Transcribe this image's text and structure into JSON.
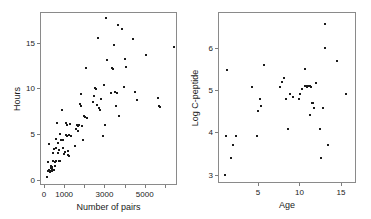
{
  "figure": {
    "background": "#ffffff",
    "point_color": "#1a1a1a",
    "frame_color": "#8a8a8a",
    "panel_count": 2
  },
  "chart_data": [
    {
      "type": "scatter",
      "title": "",
      "xlabel": "Number of pairs",
      "ylabel": "Hours",
      "xlim": [
        -200,
        6600
      ],
      "ylim": [
        -0.6,
        18.4
      ],
      "grid": false,
      "legend": null,
      "xticks": [
        0,
        1000,
        2000,
        3000,
        4000,
        5000,
        6000
      ],
      "xticklabels": [
        "0",
        "1000",
        "",
        "3000",
        "",
        "5000",
        ""
      ],
      "yticks": [
        0,
        5,
        10,
        15
      ],
      "yticklabels": [
        "0",
        "5",
        "10",
        "15"
      ],
      "points": [
        [
          120,
          0.4
        ],
        [
          150,
          1.0
        ],
        [
          170,
          2.0
        ],
        [
          200,
          1.2
        ],
        [
          210,
          4.0
        ],
        [
          260,
          0.9
        ],
        [
          280,
          1.4
        ],
        [
          300,
          1.1
        ],
        [
          310,
          1.6
        ],
        [
          330,
          1.3
        ],
        [
          350,
          1.0
        ],
        [
          360,
          1.5
        ],
        [
          380,
          2.1
        ],
        [
          400,
          3.0
        ],
        [
          420,
          2.2
        ],
        [
          440,
          1.2
        ],
        [
          460,
          3.5
        ],
        [
          480,
          2.0
        ],
        [
          500,
          1.6
        ],
        [
          520,
          3.6
        ],
        [
          540,
          2.2
        ],
        [
          560,
          4.6
        ],
        [
          600,
          6.3
        ],
        [
          620,
          4.1
        ],
        [
          650,
          3.0
        ],
        [
          680,
          2.1
        ],
        [
          700,
          3.4
        ],
        [
          720,
          2.2
        ],
        [
          760,
          5.1
        ],
        [
          800,
          4.5
        ],
        [
          840,
          7.7
        ],
        [
          880,
          3.6
        ],
        [
          900,
          4.4
        ],
        [
          950,
          2.9
        ],
        [
          1000,
          3.1
        ],
        [
          1020,
          5.0
        ],
        [
          1050,
          6.3
        ],
        [
          1080,
          6.1
        ],
        [
          1100,
          4.9
        ],
        [
          1120,
          3.2
        ],
        [
          1140,
          2.8
        ],
        [
          1180,
          2.7
        ],
        [
          1200,
          5.0
        ],
        [
          1250,
          6.2
        ],
        [
          1300,
          4.9
        ],
        [
          1500,
          3.8
        ],
        [
          1550,
          5.7
        ],
        [
          1600,
          6.1
        ],
        [
          1620,
          5.4
        ],
        [
          1650,
          6.0
        ],
        [
          1700,
          6.1
        ],
        [
          1750,
          8.4
        ],
        [
          1780,
          8.2
        ],
        [
          1800,
          9.5
        ],
        [
          1850,
          6.0
        ],
        [
          1900,
          4.4
        ],
        [
          1950,
          7.1
        ],
        [
          2000,
          7.0
        ],
        [
          2050,
          12.4
        ],
        [
          2100,
          6.9
        ],
        [
          2400,
          8.6
        ],
        [
          2450,
          9.3
        ],
        [
          2500,
          10.2
        ],
        [
          2550,
          10.1
        ],
        [
          2600,
          8.3
        ],
        [
          2650,
          15.7
        ],
        [
          2700,
          8.0
        ],
        [
          2750,
          7.8
        ],
        [
          2800,
          9.0
        ],
        [
          2900,
          4.9
        ],
        [
          2950,
          10.5
        ],
        [
          3000,
          6.1
        ],
        [
          3050,
          17.9
        ],
        [
          3100,
          13.2
        ],
        [
          3250,
          9.6
        ],
        [
          3300,
          12.4
        ],
        [
          3350,
          12.2
        ],
        [
          3400,
          14.9
        ],
        [
          3450,
          9.7
        ],
        [
          3500,
          8.2
        ],
        [
          3550,
          9.6
        ],
        [
          3600,
          17.1
        ],
        [
          3650,
          7.1
        ],
        [
          3800,
          16.6
        ],
        [
          3900,
          10.3
        ],
        [
          3950,
          13.4
        ],
        [
          4000,
          12.5
        ],
        [
          4350,
          15.5
        ],
        [
          4450,
          9.7
        ],
        [
          4550,
          8.9
        ],
        [
          5000,
          13.8
        ],
        [
          5600,
          9.1
        ],
        [
          5650,
          8.2
        ],
        [
          5700,
          8.1
        ],
        [
          6400,
          14.7
        ]
      ]
    },
    {
      "type": "scatter",
      "title": "",
      "xlabel": "Age",
      "ylabel": "Log C-peptide",
      "xlim": [
        0.2,
        16.8
      ],
      "ylim": [
        2.8,
        6.85
      ],
      "grid": false,
      "legend": null,
      "xticks": [
        5,
        10,
        15
      ],
      "xticklabels": [
        "5",
        "10",
        "15"
      ],
      "yticks": [
        3,
        4,
        5,
        6
      ],
      "yticklabels": [
        "3",
        "4",
        "5",
        "6"
      ],
      "points": [
        [
          0.9,
          3.01
        ],
        [
          1.0,
          3.93
        ],
        [
          1.2,
          5.51
        ],
        [
          1.6,
          3.42
        ],
        [
          1.9,
          3.73
        ],
        [
          2.2,
          3.93
        ],
        [
          4.2,
          5.1
        ],
        [
          4.8,
          3.93
        ],
        [
          4.9,
          4.52
        ],
        [
          5.1,
          4.81
        ],
        [
          5.2,
          4.64
        ],
        [
          5.6,
          5.61
        ],
        [
          7.5,
          5.1
        ],
        [
          7.8,
          5.21
        ],
        [
          8.0,
          5.32
        ],
        [
          8.2,
          4.81
        ],
        [
          8.5,
          4.11
        ],
        [
          8.8,
          4.93
        ],
        [
          9.8,
          4.81
        ],
        [
          10.0,
          4.92
        ],
        [
          10.2,
          5.05
        ],
        [
          10.5,
          5.11
        ],
        [
          10.6,
          5.52
        ],
        [
          10.7,
          5.11
        ],
        [
          10.8,
          5.1
        ],
        [
          10.9,
          5.11
        ],
        [
          11.0,
          5.12
        ],
        [
          11.1,
          4.43
        ],
        [
          11.2,
          5.11
        ],
        [
          11.4,
          4.71
        ],
        [
          11.5,
          4.72
        ],
        [
          11.6,
          4.61
        ],
        [
          11.9,
          5.2
        ],
        [
          12.3,
          4.11
        ],
        [
          12.5,
          3.42
        ],
        [
          12.7,
          4.61
        ],
        [
          12.9,
          6.03
        ],
        [
          13.0,
          6.6
        ],
        [
          13.3,
          3.73
        ],
        [
          14.4,
          5.71
        ],
        [
          15.5,
          4.92
        ],
        [
          9.1,
          4.86
        ],
        [
          11.3,
          5.09
        ]
      ]
    }
  ],
  "panels": [
    {
      "name": "left-scatter",
      "xlabel": "Number of pairs",
      "ylabel": "Hours"
    },
    {
      "name": "right-scatter",
      "xlabel": "Age",
      "ylabel": "Log C-peptide"
    }
  ]
}
